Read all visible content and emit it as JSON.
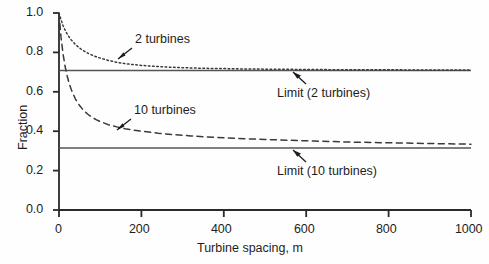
{
  "chart_data": {
    "type": "line",
    "title": "",
    "xlabel": "Turbine spacing, m",
    "ylabel": "Fraction",
    "xlim": [
      0,
      1000
    ],
    "ylim": [
      0.0,
      1.0
    ],
    "xticks": [
      "0",
      "200",
      "400",
      "600",
      "800",
      "1000"
    ],
    "xtick_values": [
      0,
      200,
      400,
      600,
      800,
      1000
    ],
    "yticks": [
      "0.0",
      "0.2",
      "0.4",
      "0.6",
      "0.8",
      "1.0"
    ],
    "ytick_values": [
      0.0,
      0.2,
      0.4,
      0.6,
      0.8,
      1.0
    ],
    "grid": false,
    "legend": "none",
    "series": [
      {
        "name": "2 turbines",
        "style": "dotted",
        "color": "#3a3a3a",
        "x": [
          0,
          5,
          10,
          15,
          20,
          25,
          30,
          40,
          50,
          60,
          70,
          80,
          90,
          100,
          120,
          140,
          160,
          180,
          200,
          240,
          280,
          320,
          360,
          400,
          450,
          500,
          560,
          620,
          700,
          780,
          860,
          940,
          1000
        ],
        "y": [
          1.0,
          0.965,
          0.935,
          0.912,
          0.893,
          0.877,
          0.863,
          0.84,
          0.822,
          0.808,
          0.796,
          0.786,
          0.778,
          0.771,
          0.759,
          0.75,
          0.743,
          0.738,
          0.734,
          0.728,
          0.724,
          0.721,
          0.719,
          0.718,
          0.716,
          0.715,
          0.714,
          0.713,
          0.712,
          0.712,
          0.711,
          0.711,
          0.711
        ]
      },
      {
        "name": "10 turbines",
        "style": "dashed",
        "color": "#3a3a3a",
        "x": [
          0,
          5,
          10,
          15,
          20,
          25,
          30,
          40,
          50,
          60,
          70,
          80,
          90,
          100,
          120,
          140,
          160,
          180,
          200,
          240,
          280,
          320,
          360,
          400,
          450,
          500,
          560,
          620,
          700,
          780,
          860,
          940,
          1000
        ],
        "y": [
          1.0,
          0.875,
          0.79,
          0.727,
          0.679,
          0.641,
          0.61,
          0.563,
          0.53,
          0.505,
          0.486,
          0.471,
          0.459,
          0.449,
          0.433,
          0.422,
          0.413,
          0.406,
          0.4,
          0.39,
          0.382,
          0.376,
          0.371,
          0.367,
          0.362,
          0.358,
          0.354,
          0.35,
          0.345,
          0.342,
          0.339,
          0.336,
          0.334
        ]
      }
    ],
    "reference_lines": [
      {
        "name": "Limit (2 turbines)",
        "value": 0.708,
        "style": "solid",
        "color": "#555555"
      },
      {
        "name": "Limit (10 turbines)",
        "value": 0.315,
        "style": "solid",
        "color": "#555555"
      }
    ],
    "annotations": [
      {
        "text": "2 turbines",
        "x_px": 97,
        "y_px": 36,
        "arrow": true
      },
      {
        "text": "10 turbines",
        "x_px": 87,
        "y_px": 107,
        "arrow": true
      },
      {
        "text": "Limit (2 turbines)",
        "x_px": 277,
        "y_px": 86,
        "arrow": true
      },
      {
        "text": "Limit (10 turbines)",
        "x_px": 277,
        "y_px": 164,
        "arrow": true
      }
    ]
  },
  "labels": {
    "ylabel": "Fraction",
    "xlabel": "Turbine spacing, m",
    "ytick_0": "0.0",
    "ytick_1": "0.2",
    "ytick_2": "0.4",
    "ytick_3": "0.6",
    "ytick_4": "0.8",
    "ytick_5": "1.0",
    "xtick_0": "0",
    "xtick_1": "200",
    "xtick_2": "400",
    "xtick_3": "600",
    "xtick_4": "800",
    "xtick_5": "1000",
    "annot_2turbines": "2 turbines",
    "annot_10turbines": "10 turbines",
    "annot_limit2": "Limit (2 turbines)",
    "annot_limit10": "Limit (10 turbines)"
  }
}
